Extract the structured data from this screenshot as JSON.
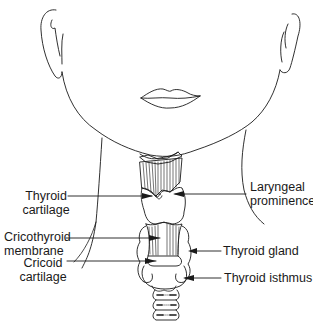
{
  "diagram": {
    "line_color": "#1a1a1a",
    "background": "#ffffff",
    "labels": {
      "thyroid_cartilage": {
        "line1": "Thyroid",
        "line2": "cartilage"
      },
      "cricothyroid_membrane": {
        "line1": "Cricothyroid",
        "line2": "membrane"
      },
      "cricoid_cartilage": {
        "line1": "Cricoid",
        "line2": "cartilage"
      },
      "laryngeal_prominence": {
        "line1": "Laryngeal",
        "line2": "prominence"
      },
      "thyroid_gland": {
        "line1": "Thyroid gland"
      },
      "thyroid_isthmus": {
        "line1": "Thyroid isthmus"
      }
    }
  }
}
